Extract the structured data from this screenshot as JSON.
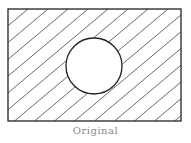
{
  "figure": {
    "caption": "Original",
    "rect": {
      "x": 8,
      "y": 9,
      "width": 173,
      "height": 112
    },
    "circle": {
      "cx": 94,
      "cy": 66,
      "r": 28
    },
    "hatch": {
      "spacing": 20,
      "angle_deg": 40,
      "fill": "outside-circle"
    },
    "colors": {
      "stroke": "#222222",
      "hatch": "#444444",
      "caption": "#8a8a8a",
      "background": "#ffffff"
    }
  }
}
